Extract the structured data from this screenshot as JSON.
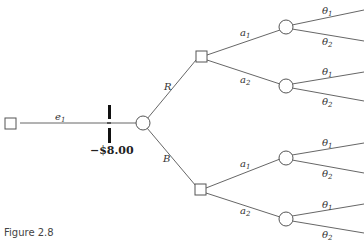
{
  "diagram": {
    "type": "decision-tree",
    "caption": "Figure 2.8",
    "root_edge": {
      "label": "e",
      "sub": "1",
      "cost": "−$8.00"
    },
    "chance_node_outcomes": [
      {
        "label": "R"
      },
      {
        "label": "B"
      }
    ],
    "decision_branches": [
      {
        "label": "a",
        "sub": "1"
      },
      {
        "label": "a",
        "sub": "2"
      }
    ],
    "state_branches": [
      {
        "label": "θ",
        "sub": "1"
      },
      {
        "label": "θ",
        "sub": "2"
      }
    ],
    "labels": {
      "e1_main": "e",
      "e1_sub": "1",
      "cost": "−$8.00",
      "R": "R",
      "B": "B",
      "a": "a",
      "sub1": "1",
      "sub2": "2",
      "theta": "θ",
      "caption": "Figure 2.8"
    },
    "colors": {
      "line": "#555555",
      "cost_bar": "#111111",
      "background": "#ffffff"
    }
  }
}
